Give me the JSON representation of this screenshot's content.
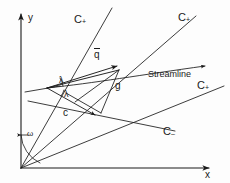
{
  "figure": {
    "ink_color": "#1a1a1a",
    "background": "#fdfdfd",
    "axes": {
      "x_label": "x",
      "y_label": "y",
      "origin_label": ""
    },
    "labels": {
      "c_plus_left": "C",
      "c_plus_left_sub": "+",
      "c_plus_top_right": "C",
      "c_plus_top_right_sub": "+",
      "c_plus_right": "C",
      "c_plus_right_sub": "+",
      "c_minus": "C",
      "c_minus_sub": "–",
      "streamline": "Streamline",
      "velocity_vector": "q",
      "group_vector": "g",
      "sound_speed": "c",
      "mach_angle_upper": "λ",
      "mach_angle_lower": "λ",
      "omega_angle": "ω"
    }
  }
}
